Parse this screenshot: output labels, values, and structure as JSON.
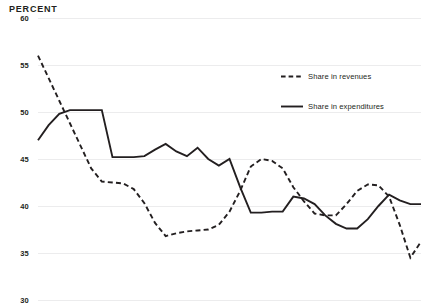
{
  "chart_data": {
    "type": "line",
    "title": "PERCENT",
    "xlabel": "",
    "ylabel": "Percent",
    "ylim": [
      30,
      60
    ],
    "yticks": [
      60,
      55,
      50,
      45,
      40,
      35,
      30
    ],
    "grid": true,
    "legend_position": "top-right",
    "xlim": [
      0,
      36
    ],
    "x": [
      0,
      1,
      2,
      3,
      4,
      5,
      6,
      7,
      8,
      9,
      10,
      11,
      12,
      13,
      14,
      15,
      16,
      17,
      18,
      19,
      20,
      21,
      22,
      23,
      24,
      25,
      26,
      27,
      28,
      29,
      30,
      31,
      32,
      33,
      34,
      35,
      36
    ],
    "series": [
      {
        "name": "Share in revenues",
        "style": "dashed",
        "color": "#231f20",
        "values": [
          56.0,
          53.6,
          51.2,
          48.8,
          46.4,
          44.0,
          42.6,
          42.5,
          42.4,
          41.8,
          40.3,
          38.2,
          36.8,
          37.1,
          37.3,
          37.4,
          37.5,
          38.0,
          39.4,
          41.6,
          44.2,
          45.0,
          44.8,
          44.0,
          42.0,
          40.5,
          39.2,
          39.0,
          39.0,
          40.2,
          41.6,
          42.3,
          42.2,
          41.0,
          38.0,
          34.5,
          36.2
        ]
      },
      {
        "name": "Share in expenditures",
        "style": "solid",
        "color": "#231f20",
        "values": [
          47.0,
          48.6,
          49.8,
          50.2,
          50.2,
          50.2,
          50.2,
          45.2,
          45.2,
          45.2,
          45.3,
          46.0,
          46.6,
          45.8,
          45.3,
          46.2,
          45.0,
          44.3,
          45.0,
          42.0,
          39.3,
          39.3,
          39.4,
          39.4,
          41.0,
          40.8,
          40.2,
          39.0,
          38.1,
          37.6,
          37.6,
          38.6,
          40.0,
          41.2,
          40.6,
          40.2,
          40.2
        ]
      }
    ]
  }
}
